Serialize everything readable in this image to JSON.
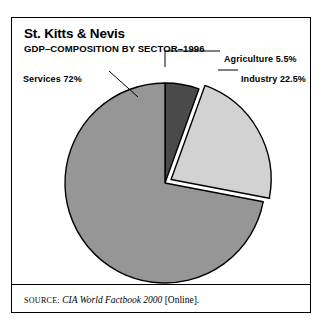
{
  "header": {
    "title": "St. Kitts & Nevis",
    "subtitle": "GDP–COMPOSITION BY SECTOR–1996"
  },
  "footer": {
    "source_prefix": "SOURCE:",
    "source_title": "CIA World Factbook 2000",
    "source_suffix": "[Online]."
  },
  "chart_data": {
    "type": "pie",
    "title": "St. Kitts & Nevis",
    "subtitle": "GDP–COMPOSITION BY SECTOR–1996",
    "xlabel": "",
    "ylabel": "",
    "legend_position": "none",
    "labels_inline": true,
    "grid": false,
    "unit": "percent",
    "start_angle_deg": 0,
    "direction": "clockwise",
    "categories": [
      "Agriculture",
      "Industry",
      "Services"
    ],
    "values": [
      5.5,
      22.5,
      72
    ],
    "slices": [
      {
        "name": "Agriculture",
        "value": 5.5,
        "label": "Agriculture 5.5%",
        "color": "#4a4a4a",
        "exploded": false
      },
      {
        "name": "Industry",
        "value": 22.5,
        "label": "Industry 22.5%",
        "color": "#d2d2d2",
        "exploded": true
      },
      {
        "name": "Services",
        "value": 72,
        "label": "Services 72%",
        "color": "#969696",
        "exploded": false
      }
    ]
  }
}
